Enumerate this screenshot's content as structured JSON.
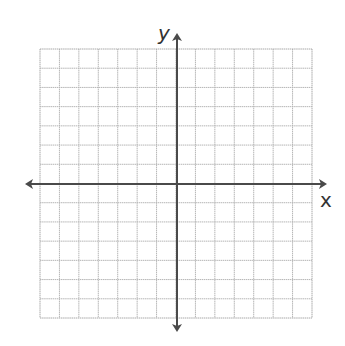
{
  "diagram": {
    "type": "coordinate-plane",
    "grid": {
      "columns": 14,
      "rows": 14,
      "left": 40,
      "top": 49,
      "right": 312,
      "bottom": 318,
      "line_color": "#b5b5b5",
      "border_color": "#a8a8a8"
    },
    "axes": {
      "color": "#4a4a4a",
      "x_axis": {
        "label": "x",
        "y": 184,
        "from": 25,
        "to": 327
      },
      "y_axis": {
        "label": "y",
        "x": 177,
        "from": 33,
        "to": 332
      }
    }
  }
}
